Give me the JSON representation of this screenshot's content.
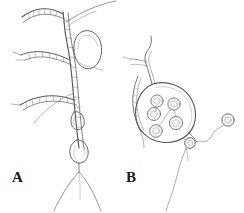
{
  "figure": {
    "background_color": "#ffffff",
    "ink_color": "#5a5a5a",
    "ink_dark_color": "#3d3d3d",
    "label_color": "#1a1a1a",
    "width": 244,
    "height": 213,
    "style": "scientific line drawing, pen and ink",
    "panels": [
      {
        "id": "a",
        "label": "A",
        "label_x": 12,
        "label_y": 170,
        "subject": "branching filamentous thallus with hyphae, beaded rhizoids and oval sporangial swellings",
        "elements": [
          "main-axis-hypha",
          "upper-left-beaded-branch",
          "upper-right-thin-branch",
          "mid-left-beaded-branch",
          "lower-left-beaded-branch",
          "large-empty-oval-sac",
          "upper-teardrop-swelling",
          "lower-oval-swelling",
          "basal-rhizoid-fork"
        ]
      },
      {
        "id": "b",
        "label": "B",
        "label_x": 126,
        "label_y": 170,
        "subject": "flask-shaped zoosporangium containing spherical spores, with discharge papilla and a released flagellate zoospore",
        "elements": [
          "apical-stalk-hypha",
          "left-rhizoid-strand",
          "zoosporangium-wall",
          "internal-spore-1",
          "internal-spore-2",
          "internal-spore-3",
          "internal-spore-4",
          "internal-spore-5",
          "spore-connecting-strands",
          "discharge-papilla",
          "flagellum",
          "released-zoospore",
          "lower-hypha-tail"
        ]
      }
    ]
  }
}
